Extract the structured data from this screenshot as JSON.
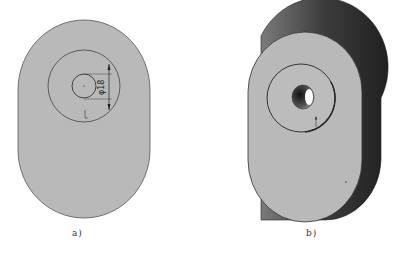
{
  "figures": [
    {
      "id": "a",
      "caption": "a)",
      "view": "front-2d",
      "dimension_label": "φ18",
      "leader_mark": "L"
    },
    {
      "id": "b",
      "caption": "b)",
      "view": "isometric-3d"
    }
  ],
  "colors": {
    "part_fill": "#b9b9b9",
    "outline": "#444444",
    "side_shade_dark": "#3a3a3a",
    "side_shade_mid": "#6a6a6a",
    "background": "#ffffff"
  }
}
